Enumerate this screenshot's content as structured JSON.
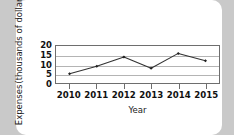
{
  "chart_data": {
    "type": "line",
    "title": "",
    "xlabel": "Year",
    "ylabel": "Expenses (thousands of dollars)",
    "ylabel_line1": "Expenses",
    "ylabel_line2": "(thousands of dollars)",
    "categories": [
      "2010",
      "2011",
      "2012",
      "2013",
      "2014",
      "2015"
    ],
    "values": [
      5,
      9,
      14,
      8,
      16,
      12
    ],
    "series": [
      {
        "name": "Expenses",
        "values": [
          5,
          9,
          14,
          8,
          16,
          12
        ]
      }
    ],
    "yticks": [
      0,
      5,
      10,
      15,
      20
    ],
    "ytick_labels": [
      "0",
      "5",
      "10",
      "15",
      "20"
    ],
    "ylim": [
      0,
      20
    ],
    "grid": true,
    "legend": "none",
    "line_color": "#333333",
    "marker": "diamond",
    "marker_color": "#222222",
    "gridline_color": "#b4b4b4",
    "axis_color": "#6e6e6e",
    "plot_background": "#ffffff"
  },
  "page": {
    "background_color": "#c9c9c9",
    "card_color": "#ffffff"
  }
}
